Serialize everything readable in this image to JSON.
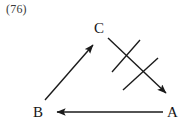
{
  "figure": {
    "number": "(76)"
  },
  "diagram": {
    "type": "directed-graph",
    "background_color": "#ffffff",
    "stroke_color": "#1a1a1a",
    "label_color": "#161616",
    "figure_number_color": "#3a3a3a",
    "nodes": [
      {
        "id": "C",
        "label": "C",
        "x": 100,
        "y": 28
      },
      {
        "id": "B",
        "label": "B",
        "x": 38,
        "y": 112
      },
      {
        "id": "A",
        "label": "A",
        "x": 172,
        "y": 112
      }
    ],
    "edges": [
      {
        "id": "edge-b-to-c",
        "label": "B to C",
        "from": "B",
        "to": "C",
        "arrowhead": "to",
        "direction": "up-right",
        "crossed_out": false,
        "x1": 45,
        "y1": 100,
        "x2": 93,
        "y2": 45
      },
      {
        "id": "edge-c-to-a",
        "label": "C to A",
        "from": "C",
        "to": "A",
        "arrowhead": "to",
        "direction": "down-right",
        "crossed_out": true,
        "x1": 108,
        "y1": 38,
        "x2": 166,
        "y2": 93
      },
      {
        "id": "edge-a-to-b",
        "label": "A to B",
        "from": "A",
        "to": "B",
        "arrowhead": "to",
        "direction": "left",
        "crossed_out": false,
        "x1": 163,
        "y1": 112,
        "x2": 57,
        "y2": 112
      }
    ],
    "cross_marks": [
      {
        "id": "cross-mark-upper",
        "x1": 140,
        "y1": 40,
        "x2": 112,
        "y2": 72
      },
      {
        "id": "cross-mark-lower",
        "x1": 158,
        "y1": 58,
        "x2": 123,
        "y2": 90
      }
    ]
  }
}
